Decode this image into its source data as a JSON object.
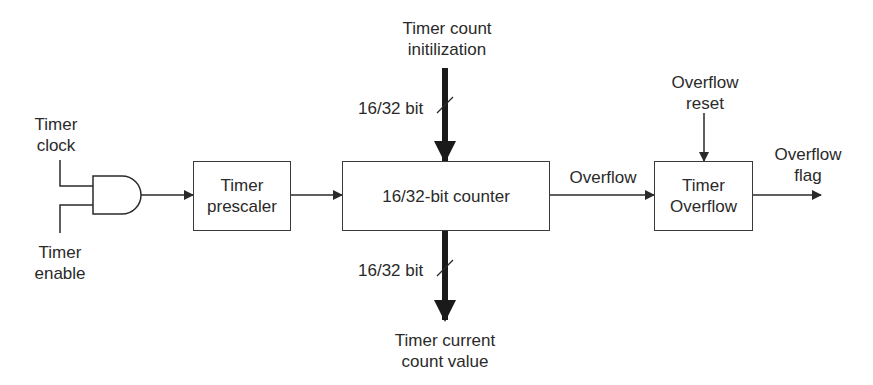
{
  "diagram": {
    "inputs": {
      "timer_clock": "Timer\nclock",
      "timer_enable": "Timer\nenable",
      "count_init": "Timer count\ninitilization",
      "overflow_reset": "Overflow\nreset"
    },
    "blocks": {
      "and_gate": "AND gate",
      "prescaler": "Timer\nprescaler",
      "counter": "16/32-bit counter",
      "timer_overflow": "Timer\nOverflow"
    },
    "signals": {
      "bus_width_top": "16/32 bit",
      "bus_width_bottom": "16/32 bit",
      "overflow": "Overflow"
    },
    "outputs": {
      "overflow_flag": "Overflow\nflag",
      "current_count": "Timer current\ncount value"
    },
    "colors": {
      "line": "#2a2a2a",
      "text": "#2a2a2a",
      "background": "#ffffff"
    }
  }
}
